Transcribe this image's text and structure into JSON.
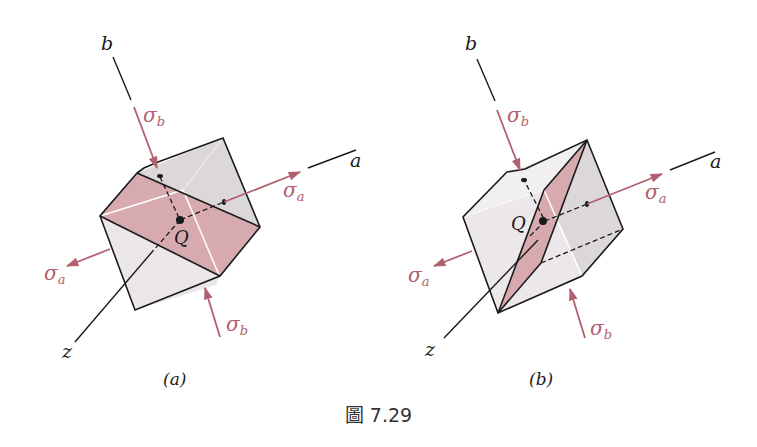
{
  "figure": {
    "caption": "圖 7.29",
    "colors": {
      "stress_arrow": "#b0606e",
      "section_plane": "#d7aab0",
      "cube_face_light": "#eeeaec",
      "cube_face_dark": "#dcd8da",
      "edge": "#1a1a1a"
    },
    "panels": [
      {
        "id": "a",
        "sublabel": "(a)",
        "axes": {
          "a": "a",
          "b": "b",
          "z": "z"
        },
        "point_label": "Q",
        "stresses": {
          "sigma_a_right": {
            "symbol": "σ",
            "sub": "a"
          },
          "sigma_a_left": {
            "symbol": "σ",
            "sub": "a"
          },
          "sigma_b_top": {
            "symbol": "σ",
            "sub": "b"
          },
          "sigma_b_bottom": {
            "symbol": "σ",
            "sub": "b"
          }
        }
      },
      {
        "id": "b",
        "sublabel": "(b)",
        "axes": {
          "a": "a",
          "b": "b",
          "z": "z"
        },
        "point_label": "Q",
        "stresses": {
          "sigma_a_right": {
            "symbol": "σ",
            "sub": "a"
          },
          "sigma_a_left": {
            "symbol": "σ",
            "sub": "a"
          },
          "sigma_b_top": {
            "symbol": "σ",
            "sub": "b"
          },
          "sigma_b_bottom": {
            "symbol": "σ",
            "sub": "b"
          }
        }
      }
    ]
  }
}
